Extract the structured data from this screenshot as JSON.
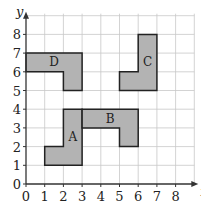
{
  "diagram": {
    "type": "coordinate-grid",
    "origin_px": [
      26,
      184
    ],
    "unit_px": 18.7,
    "x_max": 9,
    "y_max": 9,
    "x_axis_label": "x",
    "y_axis_label": "y",
    "x_ticks": [
      "0",
      "1",
      "2",
      "3",
      "4",
      "5",
      "6",
      "7",
      "8"
    ],
    "y_ticks": [
      "0",
      "1",
      "2",
      "3",
      "4",
      "5",
      "6",
      "7",
      "8"
    ],
    "colors": {
      "grid": "#c8c8c8",
      "axis": "#333333",
      "fill": "#b3b3b3",
      "stroke": "#222222"
    },
    "shapes": [
      {
        "name": "A",
        "label_at": [
          2.5,
          2.5
        ],
        "points": [
          [
            1,
            1
          ],
          [
            3,
            1
          ],
          [
            3,
            4
          ],
          [
            2,
            4
          ],
          [
            2,
            2
          ],
          [
            1,
            2
          ]
        ]
      },
      {
        "name": "B",
        "label_at": [
          4.5,
          3.5
        ],
        "points": [
          [
            3,
            3
          ],
          [
            3,
            4
          ],
          [
            6,
            4
          ],
          [
            6,
            2
          ],
          [
            5,
            2
          ],
          [
            5,
            3
          ]
        ]
      },
      {
        "name": "C",
        "label_at": [
          6.5,
          6.5
        ],
        "points": [
          [
            5,
            5
          ],
          [
            7,
            5
          ],
          [
            7,
            8
          ],
          [
            6,
            8
          ],
          [
            6,
            6
          ],
          [
            5,
            6
          ]
        ]
      },
      {
        "name": "D",
        "label_at": [
          1.5,
          6.5
        ],
        "points": [
          [
            0,
            6
          ],
          [
            0,
            7
          ],
          [
            3,
            7
          ],
          [
            3,
            5
          ],
          [
            2,
            5
          ],
          [
            2,
            6
          ]
        ]
      }
    ]
  }
}
